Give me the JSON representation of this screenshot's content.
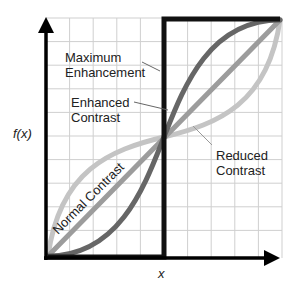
{
  "diagram": {
    "axes": {
      "y_label": "f(x)",
      "x_label": "x"
    },
    "curves": [
      {
        "name": "Maximum Enhancement",
        "label_lines": [
          "Maximum",
          "Enhancement"
        ],
        "color": "#111111",
        "shape": "step"
      },
      {
        "name": "Enhanced Contrast",
        "label_lines": [
          "Enhanced",
          "Contrast"
        ],
        "color": "#666666",
        "shape": "s-curve-steep"
      },
      {
        "name": "Normal Contrast",
        "label": "Normal Contrast",
        "color": "#999999",
        "shape": "linear"
      },
      {
        "name": "Reduced Contrast",
        "label_lines": [
          "Reduced",
          "Contrast"
        ],
        "color": "#c4c4c4",
        "shape": "inverse-s-curve"
      }
    ],
    "grid": {
      "columns": 10,
      "rows": 10,
      "color": "#cccccc"
    }
  }
}
